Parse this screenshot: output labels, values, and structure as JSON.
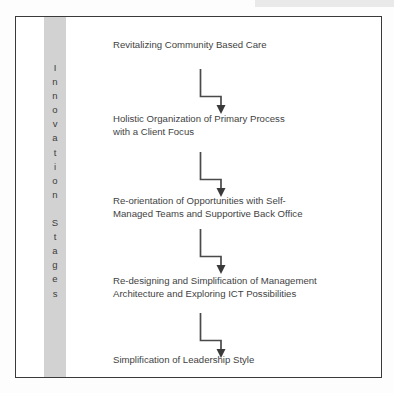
{
  "diagram": {
    "axis": {
      "label": "I\nn\nn\no\nv\na\nt\ni\no\nn\n\nS\nt\na\ng\ne\ns",
      "label_plain": "Innovation Stages",
      "band_color": "#d2d2d2"
    },
    "frame": {
      "border_color": "#3a3a3a",
      "background_color": "#ffffff"
    },
    "connector": {
      "color": "#4a4a4a",
      "style": "elbow-down-right-down-arrow",
      "count": 4
    },
    "stages": [
      {
        "index": 1,
        "text": "Revitalizing Community Based Care"
      },
      {
        "index": 2,
        "text": "Holistic Organization of Primary Process\nwith a Client Focus"
      },
      {
        "index": 3,
        "text": "Re-orientation of Opportunities with Self-\nManaged Teams and Supportive Back Office"
      },
      {
        "index": 4,
        "text": "Re-designing and Simplification of Management\nArchitecture and Exploring ICT Possibilities"
      },
      {
        "index": 5,
        "text": "Simplification of Leadership Style"
      }
    ]
  }
}
